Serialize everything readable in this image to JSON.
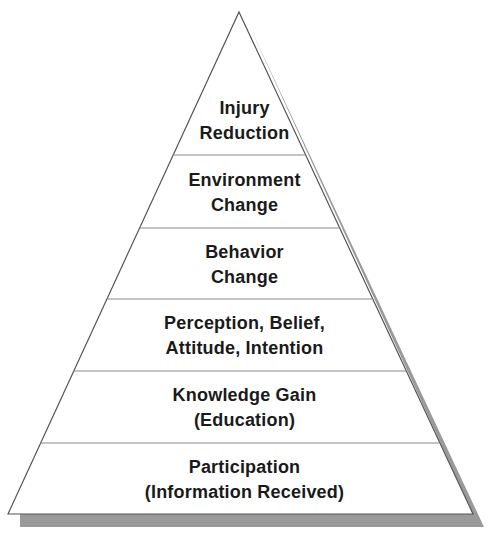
{
  "diagram": {
    "type": "pyramid",
    "colors": {
      "fill": "#ffffff",
      "outline": "#555555",
      "divider": "#8a8a8a",
      "shadow": "#9a9a9a",
      "text": "#1a1a1a"
    },
    "layers": [
      {
        "position": "top",
        "line1": "Injury",
        "line2": "Reduction"
      },
      {
        "position": "2",
        "line1": "Environment",
        "line2": "Change"
      },
      {
        "position": "3",
        "line1": "Behavior",
        "line2": "Change"
      },
      {
        "position": "4",
        "line1": "Perception, Belief,",
        "line2": "Attitude, Intention"
      },
      {
        "position": "5",
        "line1": "Knowledge Gain",
        "line2": "(Education)"
      },
      {
        "position": "bottom",
        "line1": "Participation",
        "line2": "(Information Received)"
      }
    ]
  }
}
